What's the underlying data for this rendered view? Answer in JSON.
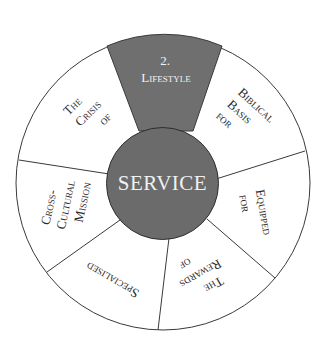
{
  "diagram": {
    "center_label": "SERVICE",
    "colors": {
      "highlight_fill": "#6f6f6f",
      "center_fill": "#6b6b6b",
      "segment_fill": "#ffffff",
      "stroke": "#3a3a3a",
      "text": "#2b2b2b",
      "highlight_text": "#f2f2f2"
    },
    "segments": [
      {
        "id": "lifestyle",
        "highlighted": true,
        "lines": [
          "2.",
          "Lifestyle"
        ]
      },
      {
        "id": "biblical-basis",
        "highlighted": false,
        "lines": [
          "Biblical",
          "Basis",
          "for"
        ]
      },
      {
        "id": "equipped",
        "highlighted": false,
        "lines": [
          "Equipped",
          "for"
        ]
      },
      {
        "id": "rewards",
        "highlighted": false,
        "lines": [
          "The",
          "Rewards",
          "of"
        ]
      },
      {
        "id": "specialised",
        "highlighted": false,
        "lines": [
          "Specialised"
        ]
      },
      {
        "id": "cross-cultural",
        "highlighted": false,
        "lines": [
          "Cross-",
          "Cultural",
          "Mission"
        ]
      },
      {
        "id": "crisis",
        "highlighted": false,
        "lines": [
          "The",
          "Crisis",
          "of"
        ]
      }
    ]
  }
}
